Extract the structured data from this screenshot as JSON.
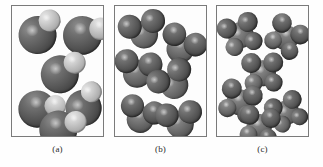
{
  "figure": {
    "type": "molecular-model-diagram",
    "background_color": "#ffffff",
    "panel_border_color": "#7a7a7a",
    "panel_count": 3,
    "panel_width": 93,
    "panel_height": 132,
    "panels": [
      {
        "id": "a",
        "caption": "(a)",
        "left": 11,
        "molecule_type": "diatomic",
        "molecule_count": 6,
        "description": "large dark sphere bonded to a smaller light sphere",
        "molecules": [
          {
            "x": 6,
            "y": 8,
            "rot": -18,
            "scale": 1.0
          },
          {
            "x": 50,
            "y": 10,
            "rot": 12,
            "scale": 1.02
          },
          {
            "x": 28,
            "y": 48,
            "rot": -6,
            "scale": 1.0
          },
          {
            "x": 4,
            "y": 84,
            "rot": 22,
            "scale": 0.98
          },
          {
            "x": 52,
            "y": 80,
            "rot": -32,
            "scale": 0.95
          },
          {
            "x": 26,
            "y": 104,
            "rot": 8,
            "scale": 1.0
          }
        ],
        "atoms": [
          {
            "role": "big",
            "cx": 20,
            "cy": 20,
            "r": 19,
            "shade": "dark"
          },
          {
            "role": "small",
            "cx": 36,
            "cy": 10,
            "r": 11,
            "shade": "light"
          }
        ]
      },
      {
        "id": "b",
        "caption": "(b)",
        "left": 114,
        "molecule_type": "triatomic",
        "molecule_count": 6,
        "description": "three spheres arranged in a bent triangular cluster",
        "molecules": [
          {
            "x": 8,
            "y": 6,
            "rot": -14,
            "scale": 1.0
          },
          {
            "x": 44,
            "y": 22,
            "rot": 26,
            "scale": 0.98
          },
          {
            "x": 1,
            "y": 46,
            "rot": 8,
            "scale": 1.0
          },
          {
            "x": 38,
            "y": 56,
            "rot": -30,
            "scale": 1.0
          },
          {
            "x": 4,
            "y": 92,
            "rot": 18,
            "scale": 0.96
          },
          {
            "x": 44,
            "y": 96,
            "rot": -8,
            "scale": 0.98
          }
        ],
        "atoms": [
          {
            "role": "center",
            "cx": 21,
            "cy": 22,
            "r": 14,
            "shade": "mid"
          },
          {
            "role": "arm-1",
            "cx": 9,
            "cy": 11,
            "r": 12,
            "shade": "dark"
          },
          {
            "role": "arm-2",
            "cx": 33,
            "cy": 11,
            "r": 12,
            "shade": "dark"
          }
        ]
      },
      {
        "id": "c",
        "caption": "(c)",
        "left": 216,
        "molecule_type": "polyatomic",
        "molecule_count": 6,
        "description": "four to five spheres in a tetrahedral-like cluster",
        "molecules": [
          {
            "x": 4,
            "y": 7,
            "rot": -20,
            "scale": 1.0
          },
          {
            "x": 48,
            "y": 12,
            "rot": 30,
            "scale": 0.98
          },
          {
            "x": 26,
            "y": 46,
            "rot": -4,
            "scale": 1.0
          },
          {
            "x": 2,
            "y": 76,
            "rot": 16,
            "scale": 1.0
          },
          {
            "x": 50,
            "y": 84,
            "rot": -26,
            "scale": 0.94
          },
          {
            "x": 22,
            "y": 100,
            "rot": 6,
            "scale": 0.98
          }
        ],
        "atoms": [
          {
            "role": "core",
            "cx": 20,
            "cy": 21,
            "r": 13,
            "shade": "mid"
          },
          {
            "role": "lobe-1",
            "cx": 9,
            "cy": 10,
            "r": 10,
            "shade": "dark"
          },
          {
            "role": "lobe-2",
            "cx": 31,
            "cy": 11,
            "r": 10,
            "shade": "dark"
          },
          {
            "role": "lobe-3",
            "cx": 10,
            "cy": 30,
            "r": 9,
            "shade": "mid"
          },
          {
            "role": "lobe-4",
            "cx": 30,
            "cy": 31,
            "r": 9,
            "shade": "dark"
          }
        ]
      }
    ]
  }
}
